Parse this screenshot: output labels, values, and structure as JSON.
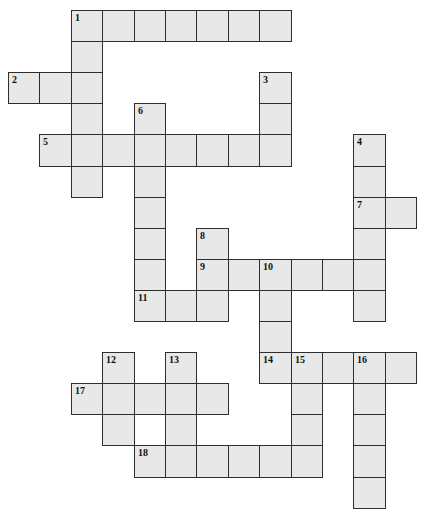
{
  "puzzle": {
    "type": "crossword",
    "fill_color": "#e8e8e8",
    "border_color": "#2e2e2e",
    "layout": {
      "origin_x": 8,
      "origin_y": 10,
      "cell_w": 31.4,
      "cell_h": 31.1
    },
    "words": [
      {
        "number": "1",
        "direction": "across",
        "row": 0,
        "col": 2,
        "length": 7
      },
      {
        "number": "1",
        "direction": "down",
        "row": 0,
        "col": 2,
        "length": 6
      },
      {
        "number": "2",
        "direction": "across",
        "row": 2,
        "col": 0,
        "length": 3
      },
      {
        "number": "3",
        "direction": "down",
        "row": 2,
        "col": 8,
        "length": 3
      },
      {
        "number": "4",
        "direction": "down",
        "row": 4,
        "col": 11,
        "length": 6
      },
      {
        "number": "5",
        "direction": "across",
        "row": 4,
        "col": 1,
        "length": 8
      },
      {
        "number": "6",
        "direction": "down",
        "row": 3,
        "col": 4,
        "length": 7
      },
      {
        "number": "7",
        "direction": "across",
        "row": 6,
        "col": 11,
        "length": 2
      },
      {
        "number": "8",
        "direction": "down",
        "row": 7,
        "col": 6,
        "length": 3
      },
      {
        "number": "9",
        "direction": "across",
        "row": 8,
        "col": 6,
        "length": 6
      },
      {
        "number": "10",
        "direction": "down",
        "row": 8,
        "col": 8,
        "length": 4
      },
      {
        "number": "11",
        "direction": "across",
        "row": 9,
        "col": 4,
        "length": 3
      },
      {
        "number": "12",
        "direction": "down",
        "row": 11,
        "col": 3,
        "length": 3
      },
      {
        "number": "13",
        "direction": "down",
        "row": 11,
        "col": 5,
        "length": 4
      },
      {
        "number": "14",
        "direction": "across",
        "row": 11,
        "col": 8,
        "length": 5
      },
      {
        "number": "15",
        "direction": "down",
        "row": 11,
        "col": 9,
        "length": 4
      },
      {
        "number": "16",
        "direction": "down",
        "row": 11,
        "col": 11,
        "length": 5
      },
      {
        "number": "17",
        "direction": "across",
        "row": 12,
        "col": 2,
        "length": 5
      },
      {
        "number": "18",
        "direction": "across",
        "row": 14,
        "col": 4,
        "length": 6
      }
    ]
  }
}
